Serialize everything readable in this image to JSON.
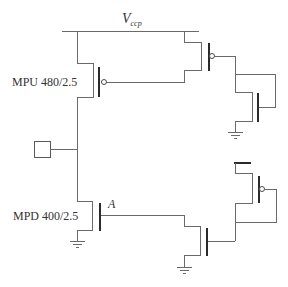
{
  "diagram": {
    "type": "circuit-schematic",
    "supply": {
      "symbol": "V",
      "subscript": "ccp"
    },
    "transistors": [
      {
        "id": "mpu",
        "type": "pmos",
        "label": "MPU 480/2.5",
        "size": "480/2.5"
      },
      {
        "id": "mpd",
        "type": "nmos",
        "label": "MPD 400/2.5",
        "size": "400/2.5"
      },
      {
        "id": "upper-right-pmos",
        "type": "pmos",
        "label": ""
      },
      {
        "id": "upper-right-nmos",
        "type": "nmos",
        "label": ""
      },
      {
        "id": "lower-right-pmos",
        "type": "pmos",
        "label": ""
      },
      {
        "id": "lower-right-nmos",
        "type": "nmos",
        "label": ""
      }
    ],
    "nodes": [
      {
        "id": "A",
        "label": "A"
      }
    ],
    "pad": {
      "label": ""
    }
  },
  "labels": {
    "vccp_main": "V",
    "vccp_sub": "ccp",
    "mpu": "MPU 480/2.5",
    "mpd": "MPD 400/2.5",
    "node_a": "A"
  }
}
